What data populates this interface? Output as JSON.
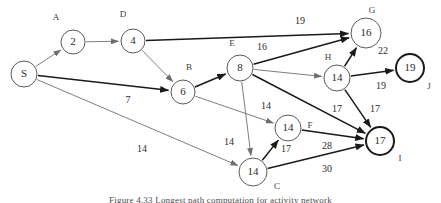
{
  "figure": {
    "caption": "Figure 4.33 Longest path computation for activity network",
    "width": 441,
    "height": 203,
    "background": "#ffffff"
  },
  "colors": {
    "node_stroke_light": "#5a5a5a",
    "node_stroke_bold": "#1a1a1a",
    "edge_light": "#6e6e6e",
    "edge_dark": "#1a1a1a",
    "text": "#2b2b2b"
  },
  "chart_data": {
    "type": "diagram",
    "title": "Longest path computation for activity network",
    "nodes": [
      {
        "id": "S",
        "tag": "",
        "value": "S",
        "cx": 24,
        "cy": 74,
        "r": 13,
        "bold": false,
        "tag_x": 0,
        "tag_y": 0
      },
      {
        "id": "A",
        "tag": "A",
        "value": "2",
        "cx": 73,
        "cy": 42,
        "r": 12,
        "bold": false,
        "tag_x": 56,
        "tag_y": 18
      },
      {
        "id": "D",
        "tag": "D",
        "value": "4",
        "cx": 133,
        "cy": 41,
        "r": 12,
        "bold": false,
        "tag_x": 123,
        "tag_y": 15
      },
      {
        "id": "B",
        "tag": "B",
        "value": "6",
        "cx": 183,
        "cy": 92,
        "r": 12,
        "bold": false,
        "tag_x": 189,
        "tag_y": 68
      },
      {
        "id": "E",
        "tag": "E",
        "value": "8",
        "cx": 240,
        "cy": 68,
        "r": 13,
        "bold": false,
        "tag_x": 232,
        "tag_y": 44
      },
      {
        "id": "G",
        "tag": "G",
        "value": "16",
        "cx": 366,
        "cy": 33,
        "r": 15,
        "bold": false,
        "tag_x": 372,
        "tag_y": 11
      },
      {
        "id": "H",
        "tag": "H",
        "value": "14",
        "cx": 337,
        "cy": 78,
        "r": 13,
        "bold": false,
        "tag_x": 328,
        "tag_y": 58
      },
      {
        "id": "J",
        "tag": "J",
        "value": "19",
        "cx": 410,
        "cy": 68,
        "r": 14,
        "bold": true,
        "tag_x": 429,
        "tag_y": 87
      },
      {
        "id": "F",
        "tag": "F",
        "value": "14",
        "cx": 288,
        "cy": 128,
        "r": 13,
        "bold": false,
        "tag_x": 310,
        "tag_y": 126
      },
      {
        "id": "I",
        "tag": "I",
        "value": "17",
        "cx": 380,
        "cy": 141,
        "r": 14,
        "bold": true,
        "tag_x": 400,
        "tag_y": 159
      },
      {
        "id": "C",
        "tag": "C",
        "value": "14",
        "cx": 253,
        "cy": 172,
        "r": 14,
        "bold": false,
        "tag_x": 277,
        "tag_y": 187
      }
    ],
    "edges": [
      {
        "from": "S",
        "to": "A",
        "weight": "",
        "dark": false,
        "label_x": 0,
        "label_y": 0
      },
      {
        "from": "A",
        "to": "D",
        "weight": "",
        "dark": false,
        "label_x": 0,
        "label_y": 0
      },
      {
        "from": "D",
        "to": "B",
        "weight": "",
        "dark": false,
        "label_x": 0,
        "label_y": 0
      },
      {
        "from": "D",
        "to": "G",
        "weight": "19",
        "dark": true,
        "label_x": 300,
        "label_y": 22
      },
      {
        "from": "S",
        "to": "B",
        "weight": "7",
        "dark": true,
        "label_x": 128,
        "label_y": 101
      },
      {
        "from": "S",
        "to": "C",
        "weight": "14",
        "dark": false,
        "label_x": 142,
        "label_y": 150
      },
      {
        "from": "B",
        "to": "E",
        "weight": "",
        "dark": true,
        "label_x": 0,
        "label_y": 0
      },
      {
        "from": "B",
        "to": "F",
        "weight": "14",
        "dark": false,
        "label_x": 266,
        "label_y": 107
      },
      {
        "from": "E",
        "to": "G",
        "weight": "16",
        "dark": true,
        "label_x": 262,
        "label_y": 48
      },
      {
        "from": "E",
        "to": "H",
        "weight": "",
        "dark": false,
        "label_x": 0,
        "label_y": 0
      },
      {
        "from": "E",
        "to": "I",
        "weight": "17",
        "dark": true,
        "label_x": 337,
        "label_y": 110
      },
      {
        "from": "E",
        "to": "C",
        "weight": "14",
        "dark": false,
        "label_x": 229,
        "label_y": 143
      },
      {
        "from": "H",
        "to": "G",
        "weight": "22",
        "dark": true,
        "label_x": 383,
        "label_y": 52
      },
      {
        "from": "H",
        "to": "J",
        "weight": "19",
        "dark": true,
        "label_x": 381,
        "label_y": 87
      },
      {
        "from": "H",
        "to": "I",
        "weight": "17",
        "dark": true,
        "label_x": 375,
        "label_y": 110
      },
      {
        "from": "C",
        "to": "F",
        "weight": "17",
        "dark": true,
        "label_x": 286,
        "label_y": 150
      },
      {
        "from": "F",
        "to": "I",
        "weight": "28",
        "dark": true,
        "label_x": 327,
        "label_y": 147
      },
      {
        "from": "C",
        "to": "I",
        "weight": "30",
        "dark": true,
        "label_x": 327,
        "label_y": 170
      }
    ]
  }
}
